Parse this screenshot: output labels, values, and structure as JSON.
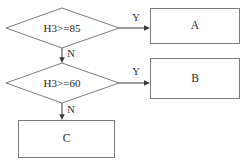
{
  "diagram": {
    "type": "flowchart",
    "decisions": [
      {
        "id": "d1",
        "label": "H3>=85"
      },
      {
        "id": "d2",
        "label": "H3>=60"
      }
    ],
    "processes": [
      {
        "id": "a",
        "label": "A"
      },
      {
        "id": "b",
        "label": "B"
      },
      {
        "id": "c",
        "label": "C"
      }
    ],
    "edges": [
      {
        "from": "d1",
        "to": "a",
        "label": "Y"
      },
      {
        "from": "d1",
        "to": "d2",
        "label": "N"
      },
      {
        "from": "d2",
        "to": "b",
        "label": "Y"
      },
      {
        "from": "d2",
        "to": "c",
        "label": "N"
      }
    ],
    "colors": {
      "shape_stroke": "#7d7d7d",
      "connector_stroke": "#4a4a4a",
      "text": "#2b2b2b",
      "background": "#ffffff"
    }
  }
}
